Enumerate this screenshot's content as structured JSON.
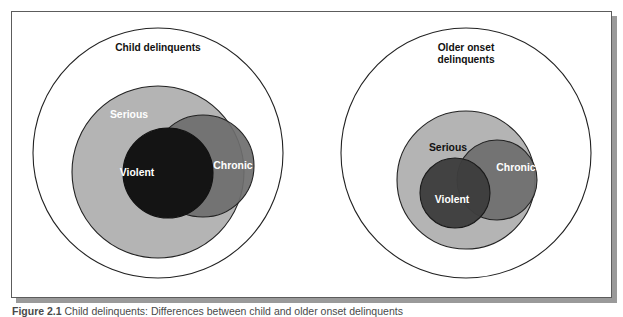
{
  "figure": {
    "caption_label": "Figure 2.1",
    "caption_text": "Child delinquents: Differences between child and older onset delinquents",
    "frame_border_color": "#5c5c5c",
    "background_color": "#ffffff"
  },
  "colors": {
    "serious_fill": "#b4b4b4",
    "chronic_fill": "#6e6e6e",
    "violent_fill_left": "#141414",
    "violent_fill_right": "#3d3d3d",
    "outline": "#222222",
    "label_light": "#ffffff",
    "label_dark": "#111111"
  },
  "diagrams": [
    {
      "id": "child-delinquents",
      "outer_label": "Child delinquents",
      "outer_label_lines": [
        "Child delinquents"
      ],
      "circles": [
        {
          "name": "outer",
          "label": "Child delinquents",
          "cx": 147,
          "cy": 142,
          "r": 125,
          "fill": "#ffffff"
        },
        {
          "name": "serious",
          "label": "Serious",
          "cx": 147,
          "cy": 161,
          "r": 86,
          "fill": "#b4b4b4"
        },
        {
          "name": "chronic",
          "label": "Chronic",
          "cx": 192,
          "cy": 155,
          "r": 51,
          "fill": "#6e6e6e"
        },
        {
          "name": "violent",
          "label": "Violent",
          "cx": 157,
          "cy": 162,
          "r": 45,
          "fill": "#141414"
        }
      ],
      "labels": [
        {
          "name": "outer-label",
          "text": "Child delinquents",
          "x": 147,
          "y": 40,
          "style": "dark"
        },
        {
          "name": "serious-label",
          "text": "Serious",
          "x": 118,
          "y": 107,
          "style": "light"
        },
        {
          "name": "chronic-label",
          "text": "Chronic",
          "x": 222,
          "y": 158,
          "style": "light"
        },
        {
          "name": "violent-label",
          "text": "Violent",
          "x": 126,
          "y": 165,
          "style": "light"
        }
      ]
    },
    {
      "id": "older-onset-delinquents",
      "outer_label": "Older onset delinquents",
      "outer_label_lines": [
        "Older onset",
        "delinquents"
      ],
      "circles": [
        {
          "name": "outer",
          "label": "Older onset delinquents",
          "cx": 455,
          "cy": 142,
          "r": 125,
          "fill": "#ffffff"
        },
        {
          "name": "serious",
          "label": "Serious",
          "cx": 455,
          "cy": 169,
          "r": 69,
          "fill": "#b4b4b4"
        },
        {
          "name": "chronic",
          "label": "Chronic",
          "cx": 486,
          "cy": 169,
          "r": 40,
          "fill": "#6e6e6e"
        },
        {
          "name": "violent",
          "label": "Violent",
          "cx": 444,
          "cy": 182,
          "r": 35,
          "fill": "#3d3d3d"
        }
      ],
      "labels": [
        {
          "name": "outer-label-line-1",
          "text": "Older onset",
          "x": 455,
          "y": 40,
          "style": "dark"
        },
        {
          "name": "outer-label-line-2",
          "text": "delinquents",
          "x": 455,
          "y": 52,
          "style": "dark"
        },
        {
          "name": "serious-label",
          "text": "Serious",
          "x": 437,
          "y": 140,
          "style": "dark"
        },
        {
          "name": "chronic-label",
          "text": "Chronic",
          "x": 505,
          "y": 160,
          "style": "light"
        },
        {
          "name": "violent-label",
          "text": "Violent",
          "x": 441,
          "y": 192,
          "style": "light"
        }
      ]
    }
  ]
}
